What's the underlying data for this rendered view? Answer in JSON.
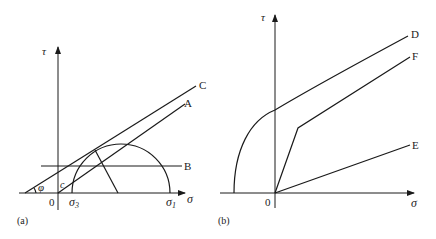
{
  "panels": [
    {
      "id": "a",
      "caption": "(a)",
      "axes": {
        "x_label": "σ",
        "y_label": "τ",
        "origin_label": "0"
      },
      "ticks": {
        "sigma3": "σ",
        "sigma3_sub": "3",
        "sigma1": "σ",
        "sigma1_sub": "1"
      },
      "annotations": {
        "phi": "φ",
        "c": "c"
      },
      "lines": {
        "A": "A",
        "B": "B",
        "C": "C"
      }
    },
    {
      "id": "b",
      "caption": "(b)",
      "axes": {
        "x_label": "σ",
        "y_label": "τ",
        "origin_label": "0"
      },
      "lines": {
        "D": "D",
        "E": "E",
        "F": "F"
      }
    }
  ],
  "colors": {
    "stroke": "#1a1a1a",
    "background": "#ffffff"
  }
}
